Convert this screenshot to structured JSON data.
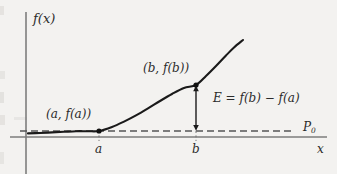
{
  "figure": {
    "title": "",
    "background_color": "#f3f2f0",
    "axis_color": "#7d7d7d",
    "curve_color": "#1a1a1a",
    "dash_color": "#555555",
    "text_color": "#2b2b2b"
  },
  "labels": {
    "y_axis": "f(x)",
    "x_axis": "x",
    "baseline": "P",
    "baseline_sub": "0",
    "tick_a": "a",
    "tick_b": "b",
    "point_a": "(a, f(a))",
    "point_b": "(b, f(b))",
    "error": "E = f(b) − f(a)"
  },
  "chart_data": {
    "type": "line",
    "title": "",
    "xlabel": "x",
    "ylabel": "f(x)",
    "grid": false,
    "legend": null,
    "annotations": [
      {
        "name": "point-a",
        "text": "(a, f(a))",
        "x": "a",
        "y": "f(a)"
      },
      {
        "name": "point-b",
        "text": "(b, f(b))",
        "x": "b",
        "y": "f(b)"
      },
      {
        "name": "error-bracket",
        "text": "E = f(b) − f(a)"
      },
      {
        "name": "baseline-level",
        "text": "P0"
      }
    ],
    "markers": [
      {
        "label": "(a, f(a))",
        "x": 99,
        "y": 131
      },
      {
        "label": "(b, f(b))",
        "x": 196,
        "y": 85
      }
    ],
    "series": [
      {
        "name": "f(x)",
        "points": [
          [
            28,
            133.4
          ],
          [
            40,
            133.0
          ],
          [
            52,
            132.4
          ],
          [
            64,
            131.8
          ],
          [
            76,
            131.2
          ],
          [
            88,
            131.2
          ],
          [
            99,
            131.0
          ],
          [
            112,
            127.0
          ],
          [
            124,
            121.6
          ],
          [
            136,
            115.4
          ],
          [
            148,
            108.4
          ],
          [
            160,
            101.0
          ],
          [
            172,
            94.0
          ],
          [
            184,
            88.0
          ],
          [
            196,
            85.0
          ],
          [
            206,
            76.0
          ],
          [
            216,
            66.0
          ],
          [
            226,
            55.5
          ],
          [
            234,
            47.5
          ],
          [
            243,
            40.0
          ]
        ]
      }
    ],
    "baseline_y": 131,
    "x_axis_y": 137,
    "y_axis_x": 26,
    "xlim": [
      20,
      325
    ],
    "ylim": [
      40,
      170
    ]
  }
}
